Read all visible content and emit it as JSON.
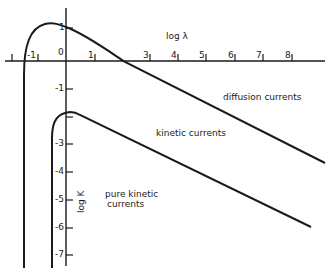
{
  "diagram": {
    "x_axis": {
      "label": "log λ",
      "ticks": [
        "-1",
        "0",
        "1",
        "2",
        "3",
        "4",
        "5",
        "6",
        "7",
        "8"
      ]
    },
    "y_axis": {
      "label": "log K",
      "ticks": [
        "1",
        "-1",
        "-2",
        "-3",
        "-4",
        "-5",
        "-6",
        "-7"
      ]
    },
    "curves": [
      {
        "name": "diffusion-currents",
        "label": "diffusion currents"
      },
      {
        "name": "kinetic-currents",
        "label": "kinetic currents"
      }
    ],
    "annotations": {
      "pure_kinetic_line1": "pure kinetic",
      "pure_kinetic_line2": "currents"
    },
    "colors": {
      "ink": "#1a1a1a",
      "background": "#ffffff"
    }
  },
  "labels": {
    "x0": "0",
    "x1": "1",
    "x3": "3",
    "x4": "4",
    "x5": "5",
    "x6": "6",
    "x7": "7",
    "x8": "8",
    "xm1": "-1",
    "y1": "1",
    "ym1": "-1",
    "ym3": "-3",
    "ym4": "-4",
    "ym5": "-5",
    "ym6": "-6",
    "ym7": "-7"
  }
}
